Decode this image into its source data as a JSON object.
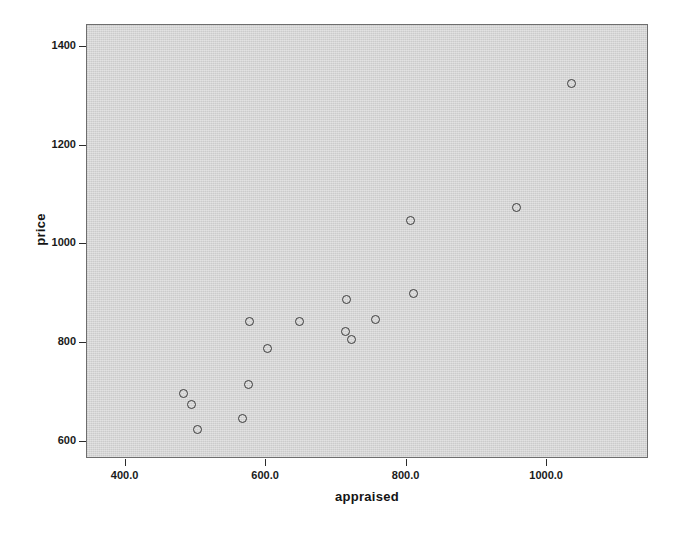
{
  "chart_data": {
    "type": "scatter",
    "title": "",
    "xlabel": "appraised",
    "ylabel": "price",
    "xlim": [
      345,
      1145
    ],
    "ylim": [
      565,
      1445
    ],
    "grid": false,
    "legend": null,
    "x_ticks": [
      400,
      600,
      800,
      1000
    ],
    "x_tick_labels": [
      "400.0",
      "600.0",
      "800.0",
      "1000.0"
    ],
    "y_ticks": [
      600,
      800,
      1000,
      1200,
      1400
    ],
    "y_tick_labels": [
      "600",
      "800",
      "1000",
      "1200",
      "1400"
    ],
    "marker": "open-circle",
    "marker_color": "#3c3c3c",
    "panel_color": "#d4d4d4",
    "points": [
      {
        "x": 482,
        "y": 698
      },
      {
        "x": 494,
        "y": 675
      },
      {
        "x": 502,
        "y": 625
      },
      {
        "x": 576,
        "y": 844
      },
      {
        "x": 575,
        "y": 716
      },
      {
        "x": 566,
        "y": 647
      },
      {
        "x": 602,
        "y": 790
      },
      {
        "x": 648,
        "y": 843
      },
      {
        "x": 713,
        "y": 823
      },
      {
        "x": 722,
        "y": 808
      },
      {
        "x": 715,
        "y": 888
      },
      {
        "x": 755,
        "y": 848
      },
      {
        "x": 810,
        "y": 900
      },
      {
        "x": 805,
        "y": 1048
      },
      {
        "x": 957,
        "y": 1075
      },
      {
        "x": 1035,
        "y": 1327
      }
    ]
  },
  "axes": {
    "x_title": "appraised",
    "y_title": "price"
  }
}
